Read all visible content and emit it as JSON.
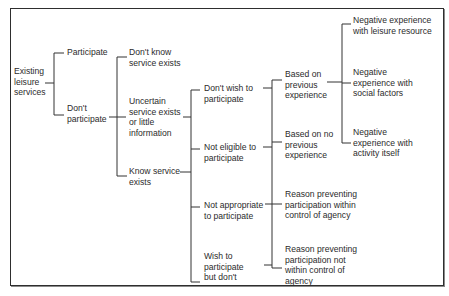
{
  "diagram": {
    "root": {
      "label": "Existing\nleisure\nservices"
    },
    "level1": [
      {
        "label": "Participate"
      },
      {
        "label": "Don't\nparticipate"
      }
    ],
    "level2": [
      {
        "label": "Don't know\nservice exists"
      },
      {
        "label": "Uncertain\nservice exists\nor little\ninformation"
      },
      {
        "label": "Know service\nexists"
      }
    ],
    "level3": [
      {
        "label": "Don't wish to\nparticipate"
      },
      {
        "label": "Not eligible to\nparticipate"
      },
      {
        "label": "Not appropriate\nto participate"
      },
      {
        "label": "Wish to\nparticipate\nbut don't"
      }
    ],
    "level4": [
      {
        "label": "Based on\nprevious\nexperience"
      },
      {
        "label": "Based on no\nprevious\nexperience"
      },
      {
        "label": "Reason preventing\nparticipation within\ncontrol of agency"
      },
      {
        "label": "Reason preventing\nparticipation not\nwithin control of\nagency"
      }
    ],
    "level5": [
      {
        "label": "Negative experience\nwith leisure resource"
      },
      {
        "label": "Negative\nexperience with\nsocial factors"
      },
      {
        "label": "Negative\nexperience with\nactivity itself"
      }
    ]
  }
}
